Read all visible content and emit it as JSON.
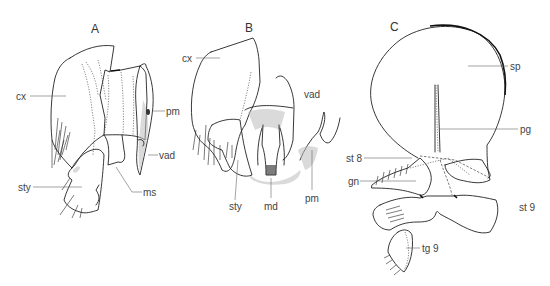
{
  "figure": {
    "panels": [
      {
        "id": "A",
        "label": "A",
        "annotations": [
          "cx",
          "pm",
          "vad",
          "sty",
          "ms"
        ]
      },
      {
        "id": "B",
        "label": "B",
        "annotations": [
          "cx",
          "vad",
          "sty",
          "md",
          "pm"
        ]
      },
      {
        "id": "C",
        "label": "C",
        "annotations": [
          "sp",
          "pg",
          "st 8",
          "gn",
          "st 9",
          "tg 9"
        ]
      }
    ]
  },
  "labels": {
    "A": {
      "panel": "A",
      "cx": "cx",
      "pm": "pm",
      "vad": "vad",
      "sty": "sty",
      "ms": "ms"
    },
    "B": {
      "panel": "B",
      "cx": "cx",
      "vad": "vad",
      "sty": "sty",
      "md": "md",
      "pm": "pm"
    },
    "C": {
      "panel": "C",
      "sp": "sp",
      "pg": "pg",
      "st8": "st 8",
      "gn": "gn",
      "st9": "st 9",
      "tg9": "tg 9"
    }
  }
}
